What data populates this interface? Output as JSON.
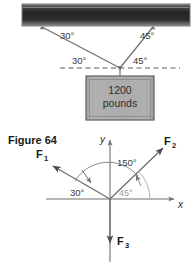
{
  "figure": {
    "caption": "Figure 64",
    "load_box": {
      "line1": "1200",
      "line2": "pounds"
    },
    "beam": {
      "name": "ceiling-beam",
      "color_dark": "#2f2f2f",
      "color_edge": "#8f8f8f"
    },
    "cable_angles": {
      "left_upper": "30°",
      "right_upper": "45°",
      "left_lower": "30°",
      "right_lower": "45°"
    },
    "vector_diagram": {
      "axis_x_label": "x",
      "axis_y_label": "y",
      "vectors": [
        {
          "label": "F",
          "subscript": "1",
          "direction": "upper-left"
        },
        {
          "label": "F",
          "subscript": "2",
          "direction": "upper-right"
        },
        {
          "label": "F",
          "subscript": "3",
          "direction": "down"
        }
      ],
      "angles": [
        {
          "value": "150°",
          "color": "#3a3a3a"
        },
        {
          "value": "30°",
          "color": "#3a3a3a"
        },
        {
          "value": "45°",
          "color": "#9a9a9a"
        }
      ]
    },
    "colors": {
      "line": "#6e6e6e",
      "box_fill": "#a8a8a8",
      "box_border": "#6b6b6b",
      "dashed": "#5a5a5a"
    }
  }
}
